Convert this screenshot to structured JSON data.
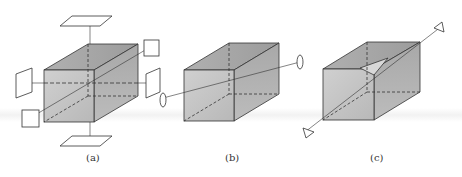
{
  "figure": {
    "panels": [
      {
        "id": "a",
        "label": "(a)",
        "description": "Cube with four square planes on the left, right, top, and bottom, with dashed axes running through the centre"
      },
      {
        "id": "b",
        "label": "(b)",
        "description": "Cube with a single diagonal line running through it, capped by elliptical rings"
      },
      {
        "id": "c",
        "label": "(c)",
        "description": "Cube with a body diagonal and a triangular cutaway, terminated by triangular arrowheads"
      }
    ],
    "colors": {
      "front_face": "#c4c4c4",
      "top_face": "#a8a8a8",
      "side_face": "#b4b4b4",
      "edge": "#333333",
      "background": "#ffffff"
    }
  }
}
